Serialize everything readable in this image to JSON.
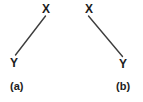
{
  "figure": {
    "background_color": "#ffffff",
    "line_color": "#3d3d3d",
    "text_color": "#1c1c1c",
    "width": 143,
    "height": 102
  },
  "panels": [
    {
      "caption": "(a)",
      "nodes": {
        "top": "X",
        "bottom": "Y"
      },
      "edge": {
        "x1": 15.5,
        "y1": 55.0,
        "x2": 45.5,
        "y2": 16.0
      }
    },
    {
      "caption": "(b)",
      "nodes": {
        "top": "X",
        "bottom": "Y"
      },
      "edge": {
        "x1": 88.5,
        "y1": 16.0,
        "x2": 122.5,
        "y2": 56.5
      }
    }
  ],
  "chart_data": {
    "type": "diagram",
    "title": "",
    "panels": [
      {
        "label": "(a)",
        "nodes": [
          {
            "id": "X",
            "label": "X",
            "x": 46,
            "y": 9
          },
          {
            "id": "Y",
            "label": "Y",
            "x": 14,
            "y": 63
          }
        ],
        "edges": [
          {
            "from": "X",
            "to": "Y",
            "style": "solid",
            "directed": false
          }
        ],
        "orientation": "X upper-right, Y lower-left"
      },
      {
        "label": "(b)",
        "nodes": [
          {
            "id": "X",
            "label": "X",
            "x": 89,
            "y": 9
          },
          {
            "id": "Y",
            "label": "Y",
            "x": 123,
            "y": 64
          }
        ],
        "edges": [
          {
            "from": "X",
            "to": "Y",
            "style": "solid",
            "directed": false
          }
        ],
        "orientation": "X upper-left, Y lower-right"
      }
    ],
    "legend": [],
    "grid": false
  }
}
